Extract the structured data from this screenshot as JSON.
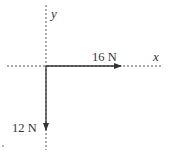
{
  "diagram": {
    "type": "force-vector-diagram",
    "axes": {
      "x_label": "x",
      "y_label": "y",
      "style": "dotted"
    },
    "vectors": [
      {
        "label": "16 N",
        "direction": "+x",
        "magnitude": 16,
        "unit": "N"
      },
      {
        "label": "12 N",
        "direction": "-y",
        "magnitude": 12,
        "unit": "N"
      }
    ],
    "colors": {
      "line": "#333333",
      "axis": "#555555",
      "background": "#ffffff"
    }
  }
}
